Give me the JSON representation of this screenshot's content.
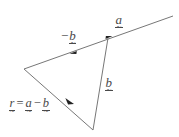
{
  "figure": {
    "width": 179,
    "height": 137,
    "background_color": "#ffffff",
    "line_color": "#777777",
    "text_color": "#4a4a4a"
  },
  "labels": {
    "a": {
      "symbol": "a",
      "prefix": "",
      "full_text": "a"
    },
    "neg_b": {
      "symbol": "b",
      "prefix": "−",
      "full_text": "−b"
    },
    "b": {
      "symbol": "b",
      "prefix": "",
      "full_text": "b"
    },
    "equation": {
      "lhs": "r",
      "equals": "=",
      "term1": "a",
      "operator": "−",
      "term2": "b",
      "full_text": "r = a − b"
    }
  },
  "geometry": {
    "vertices": {
      "left": [
        24,
        69
      ],
      "junction": [
        108,
        38
      ],
      "bottom": [
        93,
        130
      ],
      "line_end_right": [
        173,
        16
      ]
    },
    "segments": [
      {
        "name": "a-segment",
        "from": [
          108,
          38
        ],
        "to": [
          173,
          16
        ],
        "arrow_at": [
          108,
          38
        ]
      },
      {
        "name": "neg-b-segment",
        "from": [
          108,
          38
        ],
        "to": [
          24,
          69
        ],
        "arrow_at": [
          73,
          51
        ]
      },
      {
        "name": "b-segment",
        "from": [
          108,
          38
        ],
        "to": [
          93,
          130
        ],
        "arrow_at": null
      },
      {
        "name": "r-segment",
        "from": [
          93,
          130
        ],
        "to": [
          24,
          69
        ],
        "arrow_at": [
          70,
          101
        ]
      }
    ]
  }
}
